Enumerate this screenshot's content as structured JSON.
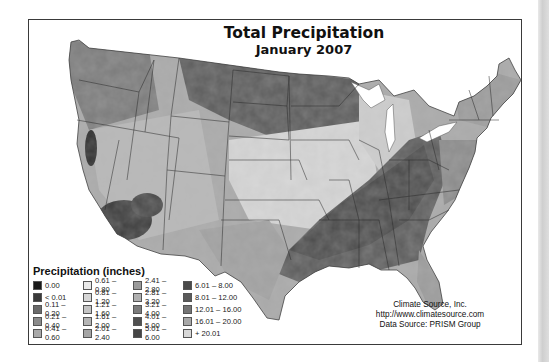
{
  "title": {
    "main": "Total Precipitation",
    "sub": "January 2007"
  },
  "legend": {
    "title": "Precipitation (inches)",
    "items": [
      {
        "label": "0.00",
        "color": "#1a1a1a"
      },
      {
        "label": "< 0.01",
        "color": "#3a3a3a"
      },
      {
        "label": "0.11 – 0.20",
        "color": "#6a6a6a"
      },
      {
        "label": "0.21 – 0.40",
        "color": "#8a8a8a"
      },
      {
        "label": "0.41 – 0.60",
        "color": "#a9a9a9"
      },
      {
        "label": "0.61 – 0.80",
        "color": "#e8e8e8"
      },
      {
        "label": "0.81 – 1.20",
        "color": "#d6d6d6"
      },
      {
        "label": "1.21 – 1.60",
        "color": "#c4c4c4"
      },
      {
        "label": "1.61 – 2.00",
        "color": "#b5b5b5"
      },
      {
        "label": "2.01 – 2.40",
        "color": "#a5a5a5"
      },
      {
        "label": "2.41 – 2.80",
        "color": "#9a9a9a"
      },
      {
        "label": "2.81 – 3.20",
        "color": "#b0b0b0"
      },
      {
        "label": "3.21 – 4.00",
        "color": "#7c7c7c"
      },
      {
        "label": "4.01 – 5.00",
        "color": "#505050"
      },
      {
        "label": "5.01 – 6.00",
        "color": "#454545"
      },
      {
        "label": "6.01 – 8.00",
        "color": "#4a4a4a"
      },
      {
        "label": "8.01 – 12.00",
        "color": "#5a5a5a"
      },
      {
        "label": "12.01 – 16.00",
        "color": "#747474"
      },
      {
        "label": "16.01 – 20.00",
        "color": "#a8a8a8"
      },
      {
        "label": "+ 20.01",
        "color": "#d8d8d8"
      }
    ]
  },
  "credit": {
    "line1": "Climate Source, Inc.",
    "line2": "http://www.climatesource.com",
    "line3": "Data Source: PRISM Group"
  },
  "map": {
    "region": "Contiguous United States",
    "variable": "Total Precipitation",
    "period": "January 2007",
    "colors": {
      "frame": "#3a3a3a",
      "background": "#ffffff",
      "state_lines": "#2a2a2a"
    }
  }
}
